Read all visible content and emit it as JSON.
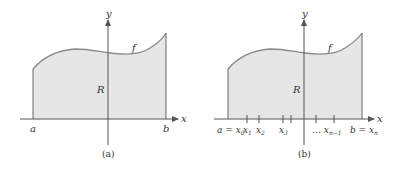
{
  "panels": [
    {
      "caption": "(a)",
      "region_label": "R",
      "function_label": "f",
      "axis_x_label": "x",
      "axis_y_label": "y",
      "left_label": "a",
      "right_label": "b"
    },
    {
      "caption": "(b)",
      "region_label": "R",
      "function_label": "f",
      "axis_x_label": "x",
      "axis_y_label": "y",
      "partition_labels": [
        "a = x0",
        "x1",
        "x2",
        "x3",
        "... xn-1",
        "b = xn"
      ]
    }
  ],
  "colors": {
    "fill": "#e6e6e6",
    "curve": "#8a8a8a",
    "axis": "#555555"
  }
}
